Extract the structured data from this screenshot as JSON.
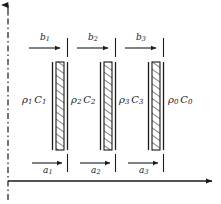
{
  "figure": {
    "type": "physics-schematic",
    "background_color": "#ffffff",
    "line_color": "#1a1a1a",
    "hatch_color": "#1a1a1a"
  },
  "axes": {
    "vertical": {
      "name": "symmetry-axis",
      "style": "dash-dot",
      "arrow": "up",
      "x": 8,
      "y_top": 4,
      "y_bottom": 200
    },
    "horizontal": {
      "name": "propagation-axis",
      "style": "solid",
      "arrow": "right",
      "y": 181,
      "x_left": 8,
      "x_right": 214
    }
  },
  "media": [
    {
      "rho": "ρ",
      "rho_sub": "1",
      "c": "C",
      "c_sub": "1",
      "label": "ρ₁C₁",
      "x": 22,
      "y": 101
    },
    {
      "rho": "ρ",
      "rho_sub": "2",
      "c": "C",
      "c_sub": "2",
      "label": "ρ₂C₂",
      "x": 71,
      "y": 101
    },
    {
      "rho": "ρ",
      "rho_sub": "3",
      "c": "C",
      "c_sub": "3",
      "label": "ρ₃C₃",
      "x": 119,
      "y": 101
    },
    {
      "rho": "ρ",
      "rho_sub": "0",
      "c": "C",
      "c_sub": "0",
      "label": "ρ₀C₀",
      "x": 168,
      "y": 101
    }
  ],
  "layers": [
    {
      "name": "barrier-layer-1",
      "left_line_x": 52,
      "hatch_x": 56,
      "hatch_width": 8,
      "right_line_x": 68,
      "y_top": 62,
      "y_bottom": 150
    },
    {
      "name": "barrier-layer-2",
      "left_line_x": 100,
      "hatch_x": 104,
      "hatch_width": 8,
      "right_line_x": 116,
      "y_top": 62,
      "y_bottom": 150
    },
    {
      "name": "barrier-layer-3",
      "left_line_x": 148,
      "hatch_x": 152,
      "hatch_width": 8,
      "right_line_x": 164,
      "y_top": 62,
      "y_bottom": 150
    }
  ],
  "top_dimensions": [
    {
      "name": "thickness-b1",
      "symbol": "b",
      "sub": "1",
      "label": "b₁",
      "arrow_x_start": 29,
      "arrow_x_end": 60,
      "arrow_y": 48,
      "tick_x": 68,
      "label_x": 40,
      "label_y": 34
    },
    {
      "name": "thickness-b2",
      "symbol": "b",
      "sub": "2",
      "label": "b₂",
      "arrow_x_start": 77,
      "arrow_x_end": 108,
      "arrow_y": 48,
      "tick_x": 116,
      "label_x": 88,
      "label_y": 34
    },
    {
      "name": "thickness-b3",
      "symbol": "b",
      "sub": "3",
      "label": "b₃",
      "arrow_x_start": 125,
      "arrow_x_end": 156,
      "arrow_y": 48,
      "tick_x": 164,
      "label_x": 136,
      "label_y": 34
    }
  ],
  "bottom_dimensions": [
    {
      "name": "spacing-a1",
      "symbol": "a",
      "sub": "1",
      "label": "a₁",
      "arrow_x_start": 32,
      "arrow_x_end": 64,
      "arrow_y": 163,
      "tick_x": 68,
      "label_x": 43,
      "label_y": 166
    },
    {
      "name": "spacing-a2",
      "symbol": "a",
      "sub": "2",
      "label": "a₂",
      "arrow_x_start": 80,
      "arrow_x_end": 112,
      "arrow_y": 163,
      "tick_x": 116,
      "label_x": 91,
      "label_y": 166
    },
    {
      "name": "spacing-a3",
      "symbol": "a",
      "sub": "3",
      "label": "a₃",
      "arrow_x_start": 128,
      "arrow_x_end": 160,
      "arrow_y": 163,
      "tick_x": 164,
      "label_x": 139,
      "label_y": 166
    }
  ]
}
